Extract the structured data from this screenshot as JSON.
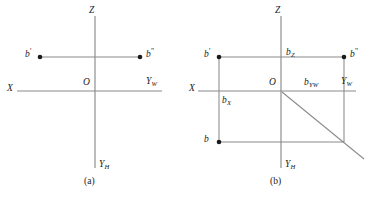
{
  "figure": {
    "width": 369,
    "height": 197,
    "background_color": "#ffffff",
    "line_color": "#8a8a8a",
    "point_color": "#1a1a1a",
    "text_color": "#1a1a1a"
  },
  "panel_a": {
    "caption": "(a)",
    "axes": {
      "z_label": "Z",
      "x_label": "X",
      "yw_label": "Y",
      "yw_sub": "W",
      "yh_label": "Y",
      "yh_sub": "H",
      "origin_label": "O"
    },
    "points": [
      {
        "id": "b-prime",
        "label": "b",
        "sup": "'",
        "x": 40,
        "y": 57
      },
      {
        "id": "b-double-prime",
        "label": "b",
        "sup": "\"",
        "x": 140,
        "y": 57
      }
    ]
  },
  "panel_b": {
    "caption": "(b)",
    "axes": {
      "z_label": "Z",
      "x_label": "X",
      "yw_label": "Y",
      "yw_sub": "W",
      "yh_label": "Y",
      "yh_sub": "H",
      "origin_label": "O"
    },
    "points": [
      {
        "id": "b-prime",
        "label": "b",
        "sup": "'",
        "x": 219,
        "y": 57
      },
      {
        "id": "b-double-prime",
        "label": "b",
        "sup": "\"",
        "x": 344,
        "y": 57
      },
      {
        "id": "b-plain",
        "label": "b",
        "sup": "",
        "x": 219,
        "y": 142
      }
    ],
    "coordinate_labels": [
      {
        "id": "bz",
        "label": "b",
        "sub": "Z"
      },
      {
        "id": "bx",
        "label": "b",
        "sub": "X"
      },
      {
        "id": "byw",
        "label": "b",
        "sub": "YW"
      }
    ]
  }
}
